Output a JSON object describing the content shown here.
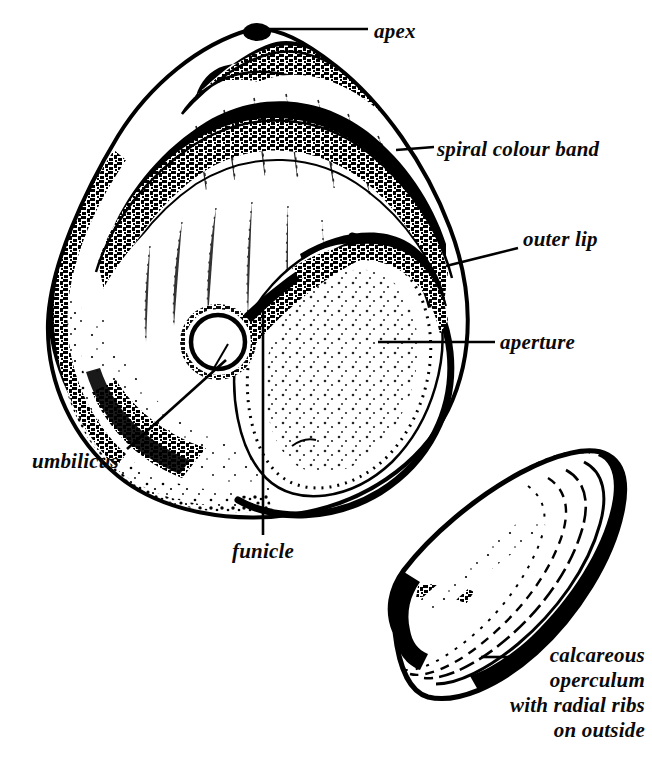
{
  "figure": {
    "background_color": "#ffffff",
    "ink_color": "#000000",
    "width": 652,
    "height": 759
  },
  "labels": {
    "apex": "apex",
    "spiral_colour_band": "spiral colour band",
    "outer_lip": "outer lip",
    "aperture": "aperture",
    "umbilicus": "umbilicus",
    "funicle": "funicle",
    "operculum_line1": "calcareous",
    "operculum_line2": "operculum",
    "operculum_line3": "with radial ribs",
    "operculum_line4": "on outside"
  },
  "leaders": {
    "apex": "horizontal-line",
    "spiral_colour_band": "horizontal-line",
    "outer_lip": "diagonal-line",
    "aperture": "horizontal-line",
    "umbilicus": "diagonal-line",
    "funicle": "vertical-line",
    "operculum": "horizontal-line"
  },
  "specimens": [
    {
      "name": "shell",
      "parts": [
        "apex",
        "spiral colour band",
        "outer lip",
        "aperture",
        "umbilicus",
        "funicle"
      ]
    },
    {
      "name": "operculum",
      "parts": [
        "calcareous operculum with radial ribs on outside"
      ]
    }
  ]
}
